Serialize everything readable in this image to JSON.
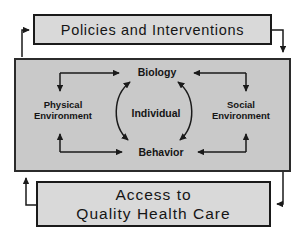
{
  "colors": {
    "bg": "#ffffff",
    "box-fill": "#d9d9d9",
    "core-fill": "#c9c9c9",
    "border": "#1a1a1a",
    "arrow": "#1a1a1a",
    "text": "#151515"
  },
  "policies_box": {
    "label": "Policies and Interventions"
  },
  "core": {
    "biology": "Biology",
    "individual": "Individual",
    "behavior": "Behavior",
    "physical_environment": {
      "line1": "Physical",
      "line2": "Environment"
    },
    "social_environment": {
      "line1": "Social",
      "line2": "Environment"
    }
  },
  "access_box": {
    "line1": "Access to",
    "line2": "Quality Health Care"
  },
  "arrows": [
    "core-to-policies",
    "policies-to-core",
    "access-to-core",
    "core-to-access",
    "physical-environment-and-biology",
    "physical-environment-and-behavior",
    "social-environment-and-biology",
    "social-environment-and-behavior",
    "biology-behavior-cycle-left",
    "biology-behavior-cycle-right"
  ]
}
